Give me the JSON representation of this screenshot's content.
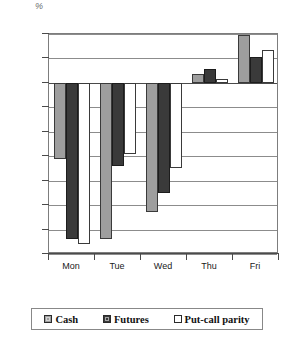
{
  "chart_data": {
    "type": "bar",
    "title": "",
    "subtitle": "",
    "xlabel": "",
    "ylabel": "%",
    "categories": [
      "Mon",
      "Tue",
      "Wed",
      "Thu",
      "Fri"
    ],
    "series": [
      {
        "name": "Cash",
        "color": "#9e9e9e",
        "values": [
          -0.155,
          -0.32,
          -0.265,
          0.018,
          0.098
        ]
      },
      {
        "name": "Futures",
        "color": "#3a3a3a",
        "values": [
          -0.32,
          -0.17,
          -0.225,
          0.028,
          0.053
        ]
      },
      {
        "name": "Put-call parity",
        "color": "#ffffff",
        "values": [
          -0.33,
          -0.145,
          -0.175,
          0.008,
          0.068
        ]
      }
    ],
    "ylim": [
      -0.35,
      0.1
    ],
    "ytick_labels": [
      "0.1",
      "0.05",
      "0",
      "-0.05",
      "-0.1",
      "-0.15",
      "-0.2",
      "-0.25",
      "-0.3",
      "-0.35"
    ],
    "ytick_values": [
      0.1,
      0.05,
      0,
      -0.05,
      -0.1,
      -0.15,
      -0.2,
      -0.25,
      -0.3,
      -0.35
    ],
    "grid": true,
    "legend_position": "bottom",
    "zero_line": 0
  },
  "legend": {
    "items": [
      {
        "label": "Cash",
        "swatch": "cash"
      },
      {
        "label": "Futures",
        "swatch": "futures"
      },
      {
        "label": "Put-call parity",
        "swatch": "putcall"
      }
    ]
  }
}
